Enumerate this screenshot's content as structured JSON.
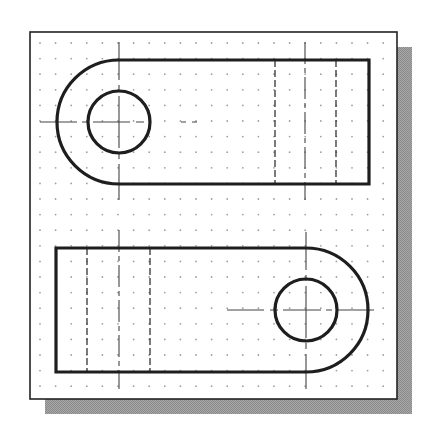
{
  "drawing": {
    "title": "Two-view orthographic drawing of a slotted link with hole on grid",
    "colors": {
      "background": "#ffffff",
      "frame": "#222222",
      "shadow": "#9a9a9a",
      "object_line": "#1e1e1e",
      "hidden_line": "#333333",
      "center_line": "#444444",
      "grid_dot": "#a0a0a0"
    },
    "frame": {
      "x": 30,
      "y": 32,
      "width": 367,
      "height": 367,
      "shadow_offset": 15
    },
    "grid": {
      "start_x": 40,
      "start_y": 43,
      "spacing": 15.6,
      "cols": 23,
      "rows": 23
    },
    "top_view": {
      "label": "Top view",
      "arc_center": [
        119,
        122
      ],
      "outer_radius": 62,
      "hole_radius": 31,
      "right_edge_x": 369,
      "hidden_lines_x": [
        275,
        336
      ],
      "centerline_vertical_x": 305,
      "centerline_vertical_y": [
        42,
        200
      ],
      "centerline_horizontal_x": [
        40,
        197
      ],
      "arc_centerline_vertical_y": [
        42,
        200
      ]
    },
    "front_view": {
      "label": "Front view",
      "arc_center": [
        306,
        310
      ],
      "outer_radius": 62,
      "hole_radius": 31,
      "left_edge_x": 56,
      "hidden_lines_x": [
        87,
        150
      ],
      "centerline_vertical_x": 119,
      "centerline_vertical_y": [
        230,
        389
      ],
      "centerline_horizontal_x": [
        227,
        385
      ],
      "arc_centerline_vertical_y": [
        232,
        389
      ]
    }
  }
}
